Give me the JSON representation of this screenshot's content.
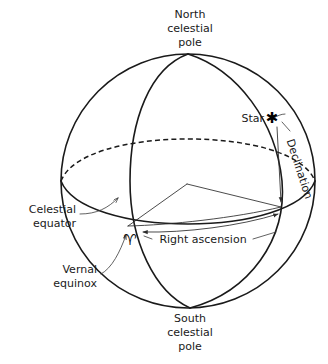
{
  "figure": {
    "type": "celestial-sphere-diagram",
    "background_color": "#ffffff",
    "line_color": "#1a1a1a"
  },
  "labels": {
    "north_pole": {
      "line1": "North",
      "line2": "celestial",
      "line3": "pole"
    },
    "south_pole": {
      "line1": "South",
      "line2": "celestial",
      "line3": "pole"
    },
    "celestial_equator": {
      "line1": "Celestial",
      "line2": "equator"
    },
    "vernal_equinox": {
      "line1": "Vernal",
      "line2": "equinox"
    },
    "star": "Star",
    "declination": "Declination",
    "right_ascension": "Right ascension",
    "aries_symbol": "♈",
    "star_symbol": "✱"
  },
  "geometry": {
    "sphere_center_x": 188,
    "sphere_center_y": 181,
    "sphere_radius": 127,
    "north_pole_point_x": 188,
    "north_pole_point_y": 54,
    "south_pole_point_x": 190,
    "south_pole_point_y": 308,
    "star_point_x": 272,
    "star_point_y": 118,
    "vernal_equinox_point_x": 128,
    "vernal_equinox_point_y": 226,
    "star_foot_point_x": 281,
    "star_foot_point_y": 207
  }
}
